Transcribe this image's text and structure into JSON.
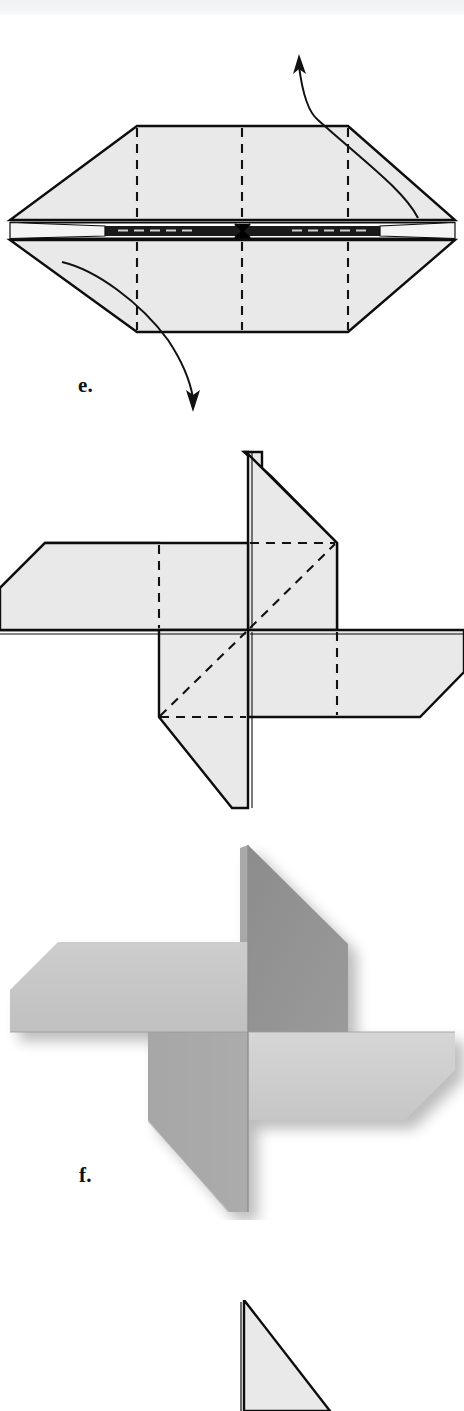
{
  "page": {
    "background_color": "#ffffff",
    "width": 464,
    "height": 1411,
    "top_band_color": "#f2f3f4"
  },
  "palette": {
    "paper_fill": "#e9e9e9",
    "line_color": "#0d0d0d",
    "crease_dash_color": "#111111",
    "photo_light_face": "#c9c9c9",
    "photo_mid_face": "#b4b4b4",
    "photo_dark_face": "#8e8e8e",
    "photo_darkest_face": "#828282",
    "photo_shadow": "#b9b9b9"
  },
  "figures": [
    {
      "id": "figure-e",
      "label": "e.",
      "type": "line-diagram",
      "caption_position": "below-left",
      "description": "Hexagonal folded paper seen edge-on with a horizontal pleat band across the middle, three vertical dashed crease lines, and two curved pull arrows.",
      "shape": "hexagon-pleated",
      "crease_lines": 3,
      "arrows": [
        {
          "name": "pull-up-arrow",
          "direction": "up",
          "label": ""
        },
        {
          "name": "pull-down-arrow",
          "direction": "down",
          "label": ""
        }
      ],
      "center_marker": "x-cross"
    },
    {
      "id": "figure-pinwheel-diagram",
      "label": "",
      "type": "line-diagram",
      "description": "Four-bladed pinwheel line drawing with dashed crease lines showing hidden edges.",
      "blades": 4,
      "crease_lines": 6
    },
    {
      "id": "figure-f",
      "label": "f.",
      "type": "photograph",
      "caption_position": "below-left",
      "description": "Grayscale photograph of the completed four-bladed paper pinwheel with soft drop shadow.",
      "blades": 4
    },
    {
      "id": "figure-next-partial",
      "label": "",
      "type": "line-diagram",
      "description": "Top tip of the next step's triangular figure, cropped at the bottom edge of the page."
    }
  ],
  "labels": {
    "e": "e.",
    "f": "f."
  }
}
